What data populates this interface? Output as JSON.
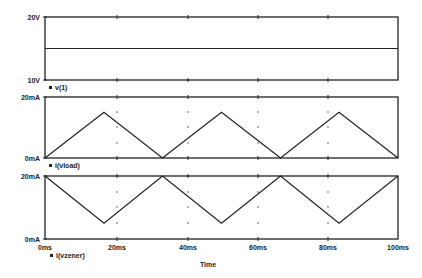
{
  "chart_data": {
    "type": "line",
    "xlabel": "Time",
    "x_ticks": [
      "0ms",
      "20ms",
      "40ms",
      "60ms",
      "80ms",
      "100ms"
    ],
    "xlim": [
      0,
      100
    ],
    "x_unit": "ms",
    "panels": [
      {
        "name": "v(1)",
        "legend": "v(1)",
        "y_unit": "V",
        "y_ticks": [
          "20V",
          "10V"
        ],
        "ylim": [
          10,
          20
        ],
        "series": [
          {
            "name": "v(1)",
            "x": [
              0,
              100
            ],
            "y": [
              15,
              15
            ]
          }
        ]
      },
      {
        "name": "i(vload)",
        "legend": "i(vload)",
        "y_unit": "mA",
        "y_ticks": [
          "20mA",
          "0mA"
        ],
        "ylim": [
          0,
          20
        ],
        "series": [
          {
            "name": "i(vload)",
            "x": [
              0,
              16.7,
              33.3,
              50,
              66.7,
              83.3,
              100
            ],
            "y": [
              0,
              15,
              0,
              15,
              0,
              15,
              0
            ]
          }
        ]
      },
      {
        "name": "i(vzener)",
        "legend": "i(vzener)",
        "y_unit": "mA",
        "y_ticks": [
          "20mA",
          "0mA"
        ],
        "ylim": [
          0,
          20
        ],
        "series": [
          {
            "name": "i(vzener)",
            "x": [
              0,
              16.7,
              33.3,
              50,
              66.7,
              83.3,
              100
            ],
            "y": [
              20,
              5,
              20,
              5,
              20,
              5,
              20
            ]
          }
        ]
      }
    ],
    "grid": "dotted at minor positions"
  },
  "labels": {
    "p1_ytop": "20V",
    "p1_ybot": "10V",
    "p1_legend": "v(1)",
    "p2_ytop": "20mA",
    "p2_ybot": "0mA",
    "p2_legend": "i(vload)",
    "p3_ytop": "20mA",
    "p3_ybot": "0mA",
    "p3_legend": "i(vzener)",
    "x0": "0ms",
    "x1": "20ms",
    "x2": "40ms",
    "x3": "60ms",
    "x4": "80ms",
    "x5": "100ms",
    "xlabel": "Time",
    "legend_marker": "■"
  }
}
